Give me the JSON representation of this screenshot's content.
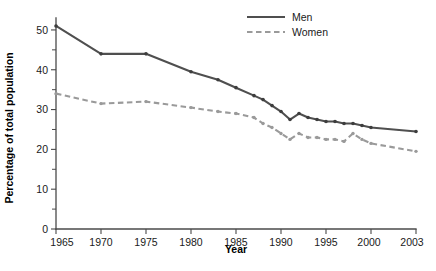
{
  "chart_data": {
    "type": "line",
    "title": "",
    "subtitle": "",
    "xlabel": "Year",
    "ylabel": "Percentage of total population",
    "xlim": [
      1965,
      2003
    ],
    "ylim": [
      0,
      53
    ],
    "grid": false,
    "legend_position": "top-right",
    "x_tick_labels": [
      "1965",
      "1970",
      "1975",
      "1980",
      "1985",
      "1990",
      "1995",
      "2000",
      "2003"
    ],
    "x_tick_values": [
      1965,
      1970,
      1975,
      1980,
      1985,
      1990,
      1995,
      2000,
      2003
    ],
    "y_tick_labels": [
      "0",
      "10",
      "20",
      "30",
      "40",
      "50"
    ],
    "y_tick_values": [
      0,
      10,
      20,
      30,
      40,
      50
    ],
    "y_minor_tick_values": [
      5,
      15,
      25,
      35,
      45
    ],
    "series": [
      {
        "name": "Men",
        "style": "solid",
        "color": "#4f4f4f",
        "x": [
          1965,
          1970,
          1975,
          1980,
          1983,
          1985,
          1987,
          1988,
          1989,
          1990,
          1991,
          1992,
          1993,
          1994,
          1995,
          1996,
          1997,
          1998,
          1999,
          2000,
          2003
        ],
        "values": [
          51.0,
          44.0,
          44.0,
          39.5,
          37.5,
          35.5,
          33.5,
          32.5,
          31.0,
          29.5,
          27.5,
          29.0,
          28.0,
          27.5,
          27.0,
          27.0,
          26.5,
          26.5,
          26.0,
          25.5,
          24.5
        ]
      },
      {
        "name": "Women",
        "style": "dashed",
        "color": "#9a9a9a",
        "x": [
          1965,
          1970,
          1975,
          1980,
          1983,
          1985,
          1987,
          1988,
          1989,
          1990,
          1991,
          1992,
          1993,
          1994,
          1995,
          1996,
          1997,
          1998,
          1999,
          2000,
          2003
        ],
        "values": [
          34.0,
          31.5,
          32.0,
          30.5,
          29.5,
          29.0,
          28.0,
          26.5,
          25.5,
          24.0,
          22.5,
          24.0,
          23.0,
          23.0,
          22.5,
          22.5,
          22.0,
          24.0,
          22.5,
          21.5,
          19.5
        ]
      }
    ],
    "legend_entries": [
      {
        "label": "Men",
        "style": "solid",
        "color": "#4f4f4f"
      },
      {
        "label": "Women",
        "style": "dashed",
        "color": "#9a9a9a"
      }
    ]
  }
}
